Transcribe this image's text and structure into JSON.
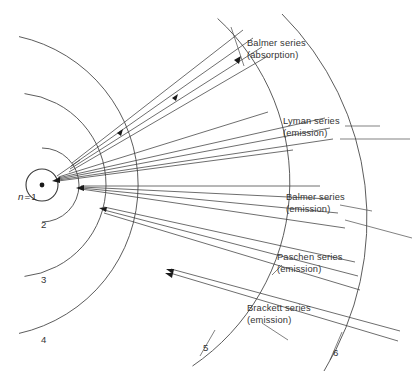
{
  "figure": {
    "background_color": "#ffffff",
    "line_color": "#3d3d3d",
    "text_color": "#343434",
    "width": 419,
    "height": 381
  },
  "nucleus": {
    "label_prefix": "n",
    "label_equals": "=",
    "label_value": "1",
    "label_full": "n = 1",
    "center_x": 42,
    "center_y": 185,
    "radius": 16,
    "dot_radius": 2.4
  },
  "shells": [
    {
      "n": 1,
      "label": "1",
      "radius": 16,
      "label_x": 30,
      "label_y": 196
    },
    {
      "n": 2,
      "label": "2",
      "radius": 37,
      "label_x": 41,
      "label_y": 225
    },
    {
      "n": 3,
      "label": "3",
      "radius": 92,
      "label_x": 41,
      "label_y": 280
    },
    {
      "n": 4,
      "label": "4",
      "radius": 152,
      "label_x": 41,
      "label_y": 340
    },
    {
      "n": 5,
      "label": "5",
      "radius": 222,
      "label_x": 205,
      "label_y": 347
    },
    {
      "n": 6,
      "label": "6",
      "radius": 290,
      "label_x": 335,
      "label_y": 352
    }
  ],
  "series": [
    {
      "id": "balmer-absorption",
      "name": "Balmer series",
      "mode": "(absorption)",
      "direction": "outward",
      "from_shell": 2,
      "ray_count": 4,
      "label_x": 247,
      "label_y": 42
    },
    {
      "id": "lyman-emission",
      "name": "Lyman series",
      "mode": "(emission)",
      "direction": "inward",
      "to_shell": 1,
      "ray_count": 5,
      "label_x": 283,
      "label_y": 120
    },
    {
      "id": "balmer-emission",
      "name": "Balmer series",
      "mode": "(emission)",
      "direction": "inward",
      "to_shell": 2,
      "ray_count": 4,
      "label_x": 286,
      "label_y": 196
    },
    {
      "id": "paschen-emission",
      "name": "Paschen series",
      "mode": "(emission)",
      "direction": "inward",
      "to_shell": 3,
      "ray_count": 3,
      "label_x": 277,
      "label_y": 256
    },
    {
      "id": "brackett-emission",
      "name": "Brackett series",
      "mode": "(emission)",
      "direction": "inward",
      "to_shell": 4,
      "ray_count": 2,
      "label_x": 247,
      "label_y": 307
    }
  ],
  "geometry": {
    "note": "Arcs are centered on the nucleus; rays radiate from shell boundaries toward the upper-right and right."
  }
}
